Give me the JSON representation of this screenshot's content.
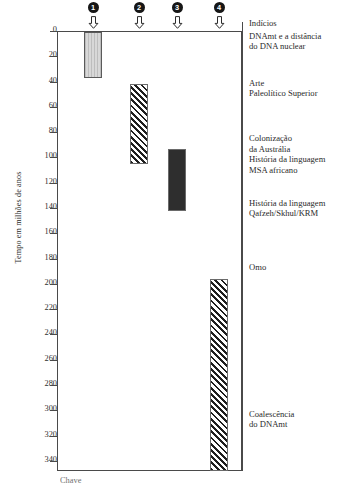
{
  "chart_data": {
    "type": "bar",
    "orientation": "vertical-ranges",
    "title": "",
    "xlabel": "",
    "ylabel": "Tempo em milhões de anos",
    "ylim": [
      0,
      348
    ],
    "y_inverted": true,
    "grid": false,
    "legend_position": "right-column",
    "yticks": [
      0,
      20,
      40,
      60,
      80,
      100,
      120,
      140,
      160,
      180,
      200,
      220,
      240,
      260,
      280,
      300,
      320,
      340
    ],
    "markers": [
      {
        "id": "1",
        "label": "1",
        "x_px": 93
      },
      {
        "id": "2",
        "label": "2",
        "x_px": 139
      },
      {
        "id": "3",
        "label": "3",
        "x_px": 177
      },
      {
        "id": "4",
        "label": "4",
        "x_px": 219
      }
    ],
    "series": [
      {
        "name": "1",
        "start": 1,
        "end": 37,
        "fill": "vertical-lines",
        "color": "#cccccc"
      },
      {
        "name": "2",
        "start": 42,
        "end": 105,
        "fill": "diagonal-hatch",
        "color": "#1f1f1f"
      },
      {
        "name": "3",
        "start": 93,
        "end": 142,
        "fill": "solid",
        "color": "#2e2e2e"
      },
      {
        "name": "4",
        "start": 196,
        "end": 348,
        "fill": "diagonal-hatch",
        "color": "#1f1f1f"
      }
    ],
    "annotations_title": "Indícios",
    "annotations": [
      {
        "text": "DNAmt e a distância\ndo DNA nuclear",
        "at": 3
      },
      {
        "text": "Arte\nPaleolítico Superior",
        "at": 40
      },
      {
        "text": "Colonização\nda Austrália\nHistória da linguagem\nMSA africano",
        "at": 84
      },
      {
        "text": "História da linguagem\nQafzeh/Skhul/KRM",
        "at": 135
      },
      {
        "text": "Omo",
        "at": 186
      },
      {
        "text": "Coalescência\ndo DNAmt",
        "at": 302
      }
    ],
    "caption": "Chave"
  }
}
